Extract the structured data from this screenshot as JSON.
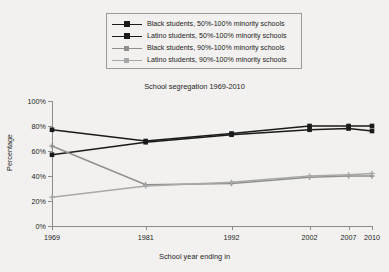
{
  "chart_data": {
    "type": "line",
    "title": "School segregation 1969-2010",
    "xlabel": "School year ending in",
    "ylabel": "Percentage",
    "categories": [
      "1969",
      "1981",
      "1992",
      "2002",
      "2007",
      "2010"
    ],
    "ylim": [
      0,
      100
    ],
    "ytick_labels": [
      "0%",
      "20%",
      "40%",
      "60%",
      "80%",
      "100%"
    ],
    "ytick_values": [
      0,
      20,
      40,
      60,
      80,
      100
    ],
    "grid": false,
    "legend_position": "above-plot",
    "series": [
      {
        "name": "Black students, 50%-100% minority schools",
        "color": "#1a1a1a",
        "marker": "square",
        "values": [
          77,
          68,
          74,
          80,
          80,
          80
        ]
      },
      {
        "name": "Latino students, 50%-100% minority schools",
        "color": "#1a1a1a",
        "marker": "square",
        "values": [
          57,
          67,
          73,
          77,
          78,
          76
        ]
      },
      {
        "name": "Black students, 90%-100% minority schools",
        "color": "#8f8f8f",
        "marker": "plus",
        "values": [
          64,
          33,
          34,
          39,
          40,
          40
        ]
      },
      {
        "name": "Latino students, 90%-100% minority schools",
        "color": "#a8a8a8",
        "marker": "plus",
        "values": [
          23,
          32,
          35,
          40,
          41,
          42
        ]
      }
    ]
  },
  "colors": {
    "background": "#f2f1ef",
    "axis": "#8c8c8c",
    "text": "#1d1d1d",
    "dark_series": "#1a1a1a",
    "gray_series": "#8f8f8f",
    "light_gray_series": "#a8a8a8"
  }
}
